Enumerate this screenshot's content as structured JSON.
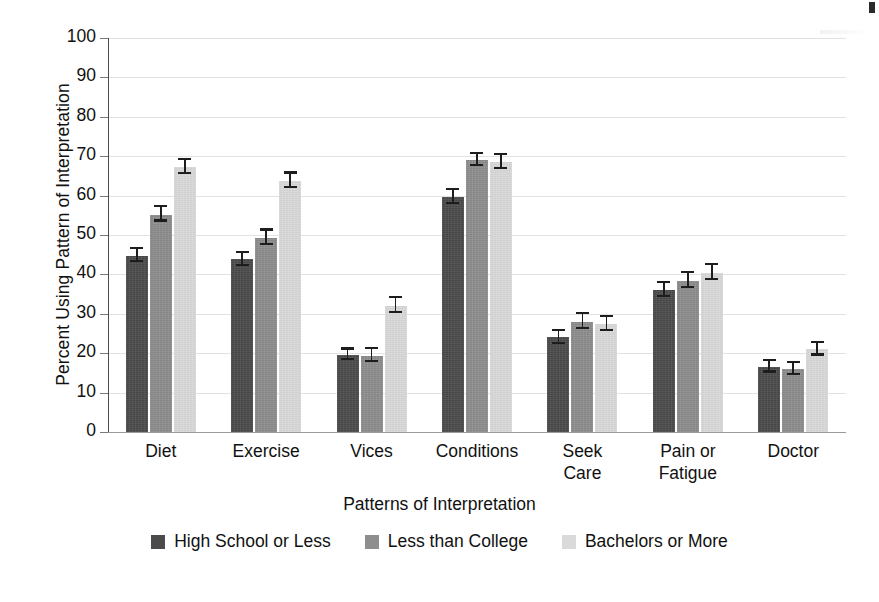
{
  "chart_data": {
    "type": "bar",
    "title": "",
    "xlabel": "Patterns of Interpretation",
    "ylabel": "Percent Using Pattern of Interpretation",
    "ylim": [
      0,
      100
    ],
    "ytick_step": 10,
    "yticks": [
      "100",
      "90",
      "80",
      "70",
      "60",
      "50",
      "40",
      "30",
      "20",
      "10",
      "0"
    ],
    "grid": true,
    "legend_position": "bottom",
    "categories": [
      "Diet",
      "Exercise",
      "Vices",
      "Conditions",
      "Seek\nCare",
      "Pain or\nFatigue",
      "Doctor"
    ],
    "series": [
      {
        "name": "High School or Less",
        "color": "#4b4b4b",
        "values": [
          44.8,
          43.8,
          19.6,
          59.6,
          24.0,
          36.0,
          16.5
        ],
        "errors": [
          1.6,
          1.7,
          1.3,
          1.7,
          1.6,
          1.7,
          1.4
        ]
      },
      {
        "name": "Less than College",
        "color": "#8e8e8e",
        "values": [
          55.2,
          49.3,
          19.4,
          69.0,
          28.0,
          38.4,
          16.0
        ],
        "errors": [
          1.8,
          1.8,
          1.7,
          1.5,
          1.9,
          1.9,
          1.5
        ]
      },
      {
        "name": "Bachelors or More",
        "color": "#dadada",
        "values": [
          67.3,
          63.8,
          32.0,
          68.5,
          27.4,
          40.4,
          21.0
        ],
        "errors": [
          1.8,
          1.8,
          1.9,
          1.7,
          1.7,
          1.9,
          1.6
        ]
      }
    ]
  },
  "legend": {
    "items": [
      {
        "label": "High School or Less",
        "color": "#4b4b4b"
      },
      {
        "label": "Less than College",
        "color": "#8e8e8e"
      },
      {
        "label": "Bachelors or More",
        "color": "#dadada"
      }
    ]
  },
  "caption": {
    "clipped_text": ""
  }
}
